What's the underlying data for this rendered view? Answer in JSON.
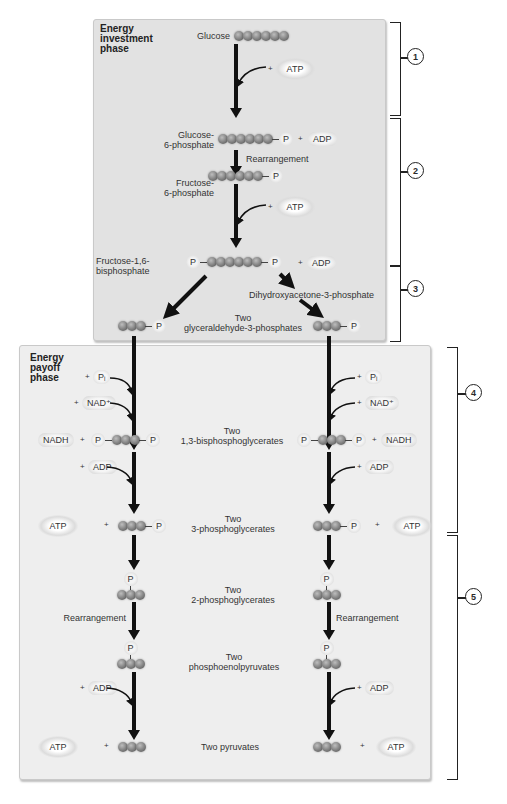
{
  "phases": {
    "investment": "Energy\ninvestment\nphase",
    "payoff": "Energy\npayoff\nphase"
  },
  "steps": [
    "1",
    "2",
    "3",
    "4",
    "5"
  ],
  "molecules": {
    "glucose": "Glucose",
    "g6p": "Glucose-\n6-phosphate",
    "f6p": "Fructose-\n6-phosphate",
    "f16bp": "Fructose-1,6-\nbisphosphate",
    "dhap": "Dihydroxyacetone-3-phosphate",
    "g3p": "Two\nglyceraldehyde-3-phosphates",
    "bpg": "Two\n1,3-bisphosphoglycerates",
    "pg3": "Two\n3-phosphoglycerates",
    "pg2": "Two\n2-phosphoglycerates",
    "pep": "Two\nphosphoenolpyruvates",
    "pyruvate": "Two pyruvates"
  },
  "labels": {
    "rearrangement": "Rearrangement",
    "atp": "ATP",
    "adp": "ADP",
    "nad": "NAD⁺",
    "nadh": "NADH",
    "pi": "Pᵢ",
    "p": "P",
    "plus": "+"
  },
  "colors": {
    "top_panel": "#e2e2e2",
    "bottom_panel": "#eeeeee",
    "arrow": "#111111"
  }
}
